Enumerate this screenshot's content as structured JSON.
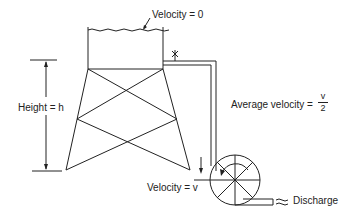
{
  "labels": {
    "top_velocity": "Velocity = 0",
    "height": "Height = h",
    "average_velocity": "Average velocity =",
    "average_velocity_num": "v",
    "average_velocity_den": "2",
    "bottom_velocity": "Velocity = v",
    "discharge": "Discharge"
  },
  "colors": {
    "line": "#222222",
    "background": "#ffffff"
  }
}
